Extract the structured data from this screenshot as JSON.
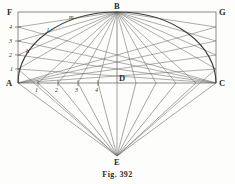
{
  "figure": {
    "caption": "Fig. 392",
    "ink_color": "#555555",
    "curve_color": "#444444",
    "label_color": "#2b2b2b",
    "background_color": "#fdfdfb",
    "width": 235,
    "height": 184
  },
  "points": [
    {
      "id": "F",
      "label": "F",
      "x": 18,
      "y": 12,
      "role": "rectangle-corner-top-left",
      "label_dx": -11,
      "label_dy": -4
    },
    {
      "id": "B",
      "label": "B",
      "x": 117,
      "y": 12,
      "role": "apex-top-center",
      "label_dx": -2,
      "label_dy": -10
    },
    {
      "id": "G",
      "label": "G",
      "x": 216,
      "y": 12,
      "role": "rectangle-corner-top-right",
      "label_dx": 3,
      "label_dy": -4
    },
    {
      "id": "A",
      "label": "A",
      "x": 18,
      "y": 83,
      "role": "rectangle-corner-bottom-left",
      "label_dx": -11,
      "label_dy": -4
    },
    {
      "id": "D",
      "label": "D",
      "x": 117,
      "y": 83,
      "role": "base-center",
      "label_dx": 2,
      "label_dy": -9
    },
    {
      "id": "C",
      "label": "C",
      "x": 216,
      "y": 83,
      "role": "rectangle-corner-bottom-right",
      "label_dx": 3,
      "label_dy": -4
    },
    {
      "id": "E",
      "label": "E",
      "x": 117,
      "y": 156,
      "role": "fan-convergence-apex",
      "label_dx": -2,
      "label_dy": 9
    }
  ],
  "left_scale": {
    "axis": "AF",
    "divisions": [
      "1",
      "2",
      "3",
      "4"
    ],
    "ticks_y": [
      69,
      55,
      41,
      27
    ]
  },
  "right_scale": {
    "axis": "CG",
    "divisions": [
      "1",
      "2",
      "3",
      "4"
    ],
    "ticks_y": [
      69,
      55,
      41,
      27
    ]
  },
  "bottom_scale": {
    "axis": "AD",
    "divisions": [
      "1",
      "2",
      "3",
      "4"
    ],
    "ticks_x": [
      38,
      58,
      78,
      98
    ]
  },
  "minor_labels": [
    {
      "id": "h",
      "label": "h",
      "x": 27,
      "y": 52
    },
    {
      "id": "l",
      "label": "l",
      "x": 48,
      "y": 31
    },
    {
      "id": "m",
      "label": "m",
      "x": 70,
      "y": 19
    }
  ],
  "geometry": {
    "rectangle": {
      "x": 18,
      "y": 12,
      "width": 198,
      "height": 71
    },
    "arc": {
      "type": "elliptical",
      "from": "A",
      "apex": "B",
      "to": "C",
      "semi_major": 99,
      "semi_minor": 71
    },
    "fan": {
      "apex": "E",
      "ray_count": 9,
      "targets": [
        "A",
        "1",
        "2",
        "3",
        "4",
        "D",
        "4'",
        "3'",
        "2'",
        "1'",
        "C"
      ]
    },
    "construction_lines": {
      "from_B_to_left_ticks": 4,
      "from_B_to_bottom_ticks": 4,
      "from_A_to_top_divisions": 4,
      "from_C_to_top_divisions": 4
    }
  }
}
